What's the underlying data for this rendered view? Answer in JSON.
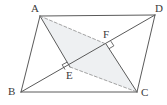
{
  "figure": {
    "type": "geometry-diagram",
    "shape": "parallelogram",
    "width": 167,
    "height": 105,
    "background_color": "#ffffff",
    "stroke_color": "#5a5a5a",
    "shade_color": "#eef0f2",
    "label_color": "#3a3a3a"
  },
  "labels": {
    "A": "A",
    "B": "B",
    "C": "C",
    "D": "D",
    "E": "E",
    "F": "F"
  },
  "points": {
    "A": {
      "x": 40,
      "y": 16
    },
    "B": {
      "x": 21,
      "y": 92
    },
    "C": {
      "x": 137,
      "y": 92
    },
    "D": {
      "x": 155,
      "y": 15
    },
    "E": {
      "x": 70,
      "y": 67
    },
    "F": {
      "x": 106,
      "y": 44
    }
  },
  "label_positions": {
    "A": {
      "x": 31,
      "y": 3
    },
    "B": {
      "x": 8,
      "y": 86
    },
    "C": {
      "x": 141,
      "y": 87
    },
    "D": {
      "x": 155,
      "y": 3
    },
    "E": {
      "x": 66,
      "y": 70
    },
    "F": {
      "x": 103,
      "y": 29
    }
  },
  "segments": [
    {
      "name": "side-AB",
      "from": "A",
      "to": "B",
      "style": "solid"
    },
    {
      "name": "side-BC",
      "from": "B",
      "to": "C",
      "style": "solid"
    },
    {
      "name": "side-CD",
      "from": "C",
      "to": "D",
      "style": "solid"
    },
    {
      "name": "side-DA",
      "from": "D",
      "to": "A",
      "style": "solid"
    },
    {
      "name": "diagonal-BD",
      "from": "B",
      "to": "D",
      "style": "solid"
    },
    {
      "name": "segment-AE",
      "from": "A",
      "to": "E",
      "style": "solid"
    },
    {
      "name": "segment-EC",
      "from": "E",
      "to": "C",
      "style": "dashed"
    },
    {
      "name": "segment-CF",
      "from": "C",
      "to": "F",
      "style": "solid"
    },
    {
      "name": "segment-AF",
      "from": "A",
      "to": "F",
      "style": "dashed"
    },
    {
      "name": "segment-AC",
      "from": "A",
      "to": "C",
      "style": "none"
    }
  ],
  "right_angles": [
    {
      "name": "right-angle-at-E",
      "at": "E"
    },
    {
      "name": "right-angle-at-F",
      "at": "F"
    }
  ],
  "shaded_regions": [
    {
      "name": "shaded-quad-AECF",
      "vertices": [
        "A",
        "E",
        "C",
        "F"
      ]
    }
  ]
}
